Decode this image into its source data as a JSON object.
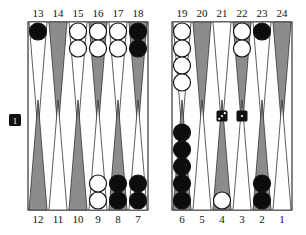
{
  "board": {
    "colors": {
      "dark_point": "#8c8c8c",
      "light_point": "#ffffff",
      "border": "#333333",
      "black_checker": "#0d0d0d",
      "white_checker": "#ffffff"
    },
    "top_labels_left": [
      "13",
      "14",
      "15",
      "16",
      "17",
      "18"
    ],
    "top_labels_right": [
      "19",
      "20",
      "21",
      "22",
      "23",
      "24"
    ],
    "bottom_labels_left": [
      "12",
      "11",
      "10",
      "9",
      "8",
      "7"
    ],
    "bottom_labels_right": [
      "6",
      "5",
      "4",
      "3",
      "2",
      "1"
    ],
    "points": {
      "13": {
        "shade": "light",
        "checkers": [
          {
            "color": "black",
            "count": 1
          }
        ]
      },
      "14": {
        "shade": "dark",
        "checkers": []
      },
      "15": {
        "shade": "light",
        "checkers": [
          {
            "color": "white",
            "count": 2
          }
        ]
      },
      "16": {
        "shade": "dark",
        "checkers": [
          {
            "color": "white",
            "count": 2
          }
        ]
      },
      "17": {
        "shade": "light",
        "checkers": [
          {
            "color": "white",
            "count": 2
          }
        ]
      },
      "18": {
        "shade": "dark",
        "checkers": [
          {
            "color": "black",
            "count": 2
          }
        ]
      },
      "19": {
        "shade": "light",
        "checkers": [
          {
            "color": "white",
            "count": 4
          }
        ]
      },
      "20": {
        "shade": "dark",
        "checkers": []
      },
      "21": {
        "shade": "light",
        "checkers": []
      },
      "22": {
        "shade": "dark",
        "checkers": [
          {
            "color": "white",
            "count": 2
          }
        ]
      },
      "23": {
        "shade": "light",
        "checkers": [
          {
            "color": "black",
            "count": 1
          }
        ]
      },
      "24": {
        "shade": "dark",
        "checkers": []
      },
      "12": {
        "shade": "dark",
        "checkers": []
      },
      "11": {
        "shade": "light",
        "checkers": []
      },
      "10": {
        "shade": "dark",
        "checkers": []
      },
      "9": {
        "shade": "light",
        "checkers": [
          {
            "color": "white",
            "count": 2
          }
        ]
      },
      "8": {
        "shade": "dark",
        "checkers": [
          {
            "color": "black",
            "count": 2
          }
        ]
      },
      "7": {
        "shade": "light",
        "checkers": [
          {
            "color": "black",
            "count": 2
          }
        ]
      },
      "6": {
        "shade": "dark",
        "checkers": [
          {
            "color": "black",
            "count": 5
          }
        ]
      },
      "5": {
        "shade": "light",
        "checkers": []
      },
      "4": {
        "shade": "dark",
        "checkers": [
          {
            "color": "white",
            "count": 1
          }
        ]
      },
      "3": {
        "shade": "light",
        "checkers": []
      },
      "2": {
        "shade": "dark",
        "checkers": [
          {
            "color": "black",
            "count": 2
          }
        ]
      },
      "1": {
        "shade": "light",
        "checkers": []
      }
    },
    "dice": [
      3,
      1
    ],
    "doubling_cube": "1"
  }
}
